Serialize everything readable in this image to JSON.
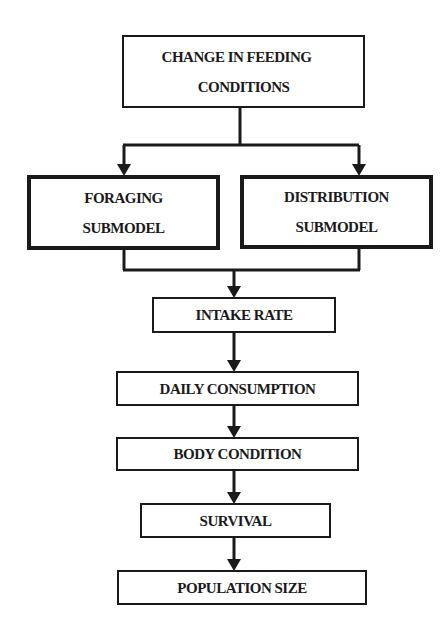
{
  "diagram": {
    "type": "flowchart",
    "nodes": {
      "change": {
        "line1": "CHANGE IN FEEDING",
        "line2": "CONDITIONS"
      },
      "foraging": {
        "line1": "FORAGING",
        "line2": "SUBMODEL"
      },
      "distribution": {
        "line1": "DISTRIBUTION",
        "line2": "SUBMODEL"
      },
      "intake": {
        "label": "INTAKE RATE"
      },
      "daily": {
        "label": "DAILY CONSUMPTION"
      },
      "body": {
        "label": "BODY CONDITION"
      },
      "survival": {
        "label": "SURVIVAL"
      },
      "population": {
        "label": "POPULATION SIZE"
      }
    },
    "edges": [
      [
        "CHANGE IN FEEDING CONDITIONS",
        "FORAGING SUBMODEL"
      ],
      [
        "CHANGE IN FEEDING CONDITIONS",
        "DISTRIBUTION SUBMODEL"
      ],
      [
        "FORAGING SUBMODEL",
        "INTAKE RATE"
      ],
      [
        "DISTRIBUTION SUBMODEL",
        "INTAKE RATE"
      ],
      [
        "INTAKE RATE",
        "DAILY CONSUMPTION"
      ],
      [
        "DAILY CONSUMPTION",
        "BODY CONDITION"
      ],
      [
        "BODY CONDITION",
        "SURVIVAL"
      ],
      [
        "SURVIVAL",
        "POPULATION SIZE"
      ]
    ],
    "colors": {
      "stroke": "#1a1a1a",
      "background": "#ffffff"
    }
  }
}
